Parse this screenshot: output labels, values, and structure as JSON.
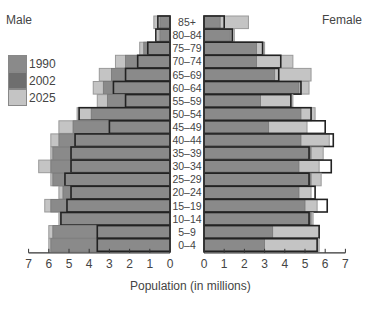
{
  "chart_data": {
    "type": "bar",
    "subtype": "population-pyramid",
    "title": "",
    "xlabel": "Population (in millions)",
    "ylabel": "",
    "side_labels": {
      "left": "Male",
      "right": "Female"
    },
    "categories": [
      "85+",
      "80–84",
      "75–79",
      "70–74",
      "65–69",
      "60–64",
      "55–59",
      "50–54",
      "45–49",
      "40–44",
      "35–39",
      "30–34",
      "25–29",
      "20–24",
      "15–19",
      "10–14",
      "5–9",
      "0–4"
    ],
    "xlim": [
      0,
      7
    ],
    "xticks": [
      0,
      1,
      2,
      3,
      4,
      5,
      6,
      7
    ],
    "legend": [
      "1990",
      "2002",
      "2025"
    ],
    "colors": {
      "1990": "#8a8a8a",
      "2002": "#6e6e6e",
      "2025": "#c4c4c4"
    },
    "series": [
      {
        "name": "1990",
        "side": "male",
        "values": [
          0.5,
          0.5,
          1.3,
          2.2,
          2.9,
          3.3,
          3.1,
          3.9,
          4.8,
          5.5,
          5.8,
          5.9,
          5.8,
          5.3,
          5.9,
          5.4,
          5.8,
          5.9
        ]
      },
      {
        "name": "2002",
        "side": "male",
        "values": [
          0.6,
          0.7,
          1.1,
          1.6,
          2.2,
          2.8,
          2.2,
          4.5,
          3.0,
          4.7,
          4.9,
          4.9,
          5.2,
          4.9,
          5.1,
          5.4,
          3.6,
          3.6
        ]
      },
      {
        "name": "2025",
        "side": "male",
        "values": [
          0.8,
          0.6,
          1.5,
          2.7,
          3.5,
          3.8,
          3.6,
          4.6,
          5.5,
          5.9,
          5.9,
          6.5,
          5.9,
          5.5,
          6.2,
          5.5,
          6.0,
          6.0
        ]
      },
      {
        "name": "1990",
        "side": "female",
        "values": [
          0.8,
          1.3,
          2.6,
          2.6,
          3.5,
          4.7,
          2.8,
          4.8,
          3.2,
          4.8,
          5.3,
          4.7,
          5.3,
          4.7,
          5.0,
          5.3,
          3.4,
          3.0
        ]
      },
      {
        "name": "2002",
        "side": "female",
        "values": [
          1.0,
          1.4,
          2.9,
          3.8,
          3.7,
          4.8,
          4.3,
          5.3,
          6.0,
          6.4,
          5.2,
          6.3,
          5.2,
          5.5,
          6.1,
          5.2,
          5.7,
          5.6
        ]
      },
      {
        "name": "2025",
        "side": "female",
        "values": [
          2.2,
          1.5,
          3.0,
          4.4,
          5.3,
          5.2,
          4.4,
          5.5,
          5.1,
          6.2,
          5.9,
          5.7,
          5.8,
          5.3,
          5.6,
          5.4,
          5.7,
          5.7
        ]
      }
    ]
  },
  "labels": {
    "male": "Male",
    "female": "Female",
    "xlabel": "Population (in millions)"
  }
}
